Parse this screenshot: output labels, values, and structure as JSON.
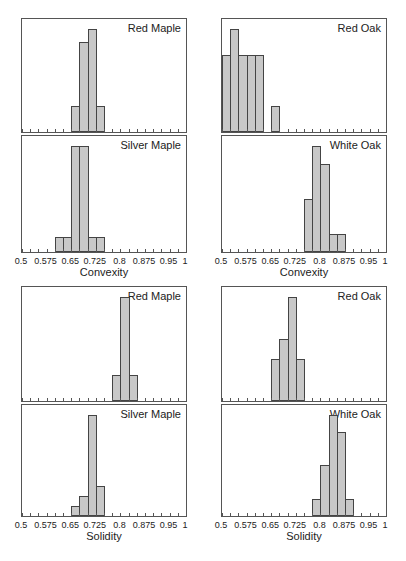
{
  "chart_data": [
    {
      "type": "bar",
      "title": "Red Maple",
      "xlabel": "Convexity",
      "xlim": [
        0.5,
        1.0
      ],
      "bin_width": 0.025,
      "bins_start": [
        0.65,
        0.675,
        0.7,
        0.725
      ],
      "values": [
        2,
        7,
        8,
        2
      ]
    },
    {
      "type": "bar",
      "title": "Silver Maple",
      "xlabel": "Convexity",
      "xlim": [
        0.5,
        1.0
      ],
      "bin_width": 0.025,
      "bins_start": [
        0.6,
        0.625,
        0.65,
        0.675,
        0.7,
        0.725
      ],
      "values": [
        1,
        1,
        7,
        7,
        1,
        1
      ]
    },
    {
      "type": "bar",
      "title": "Red Oak",
      "xlabel": "Convexity",
      "xlim": [
        0.5,
        1.0
      ],
      "bin_width": 0.025,
      "bins_start": [
        0.5,
        0.525,
        0.55,
        0.575,
        0.6,
        0.625,
        0.65
      ],
      "values": [
        3,
        4,
        3,
        3,
        3,
        0,
        1
      ]
    },
    {
      "type": "bar",
      "title": "White Oak",
      "xlabel": "Convexity",
      "xlim": [
        0.5,
        1.0
      ],
      "bin_width": 0.025,
      "bins_start": [
        0.75,
        0.775,
        0.8,
        0.825,
        0.85
      ],
      "values": [
        3,
        6,
        5,
        1,
        1
      ]
    },
    {
      "type": "bar",
      "title": "Red Maple",
      "xlabel": "Solidity",
      "xlim": [
        0.5,
        1.0
      ],
      "bin_width": 0.025,
      "bins_start": [
        0.775,
        0.8,
        0.825
      ],
      "values": [
        1,
        4,
        1
      ]
    },
    {
      "type": "bar",
      "title": "Silver Maple",
      "xlabel": "Solidity",
      "xlim": [
        0.5,
        1.0
      ],
      "bin_width": 0.025,
      "bins_start": [
        0.65,
        0.675,
        0.7,
        0.725
      ],
      "values": [
        1,
        2,
        10,
        3
      ]
    },
    {
      "type": "bar",
      "title": "Red Oak",
      "xlabel": "Solidity",
      "xlim": [
        0.5,
        1.0
      ],
      "bin_width": 0.025,
      "bins_start": [
        0.65,
        0.675,
        0.7,
        0.725
      ],
      "values": [
        2,
        3,
        5,
        2
      ]
    },
    {
      "type": "bar",
      "title": "White Oak",
      "xlabel": "Solidity",
      "xlim": [
        0.5,
        1.0
      ],
      "bin_width": 0.025,
      "bins_start": [
        0.775,
        0.8,
        0.825,
        0.85,
        0.875
      ],
      "values": [
        1,
        3,
        6,
        5,
        1
      ]
    }
  ],
  "axis": {
    "tick_labels": [
      "0.5",
      "0.575",
      "0.65",
      "0.725",
      "0.8",
      "0.875",
      "0.95",
      "1"
    ],
    "tick_label_values": [
      0.5,
      0.575,
      0.65,
      0.725,
      0.8,
      0.875,
      0.95,
      1.0
    ]
  },
  "groups": [
    {
      "xlabel": "Convexity",
      "top": 0,
      "bottom": 1
    },
    {
      "xlabel": "Convexity",
      "top": 2,
      "bottom": 3
    },
    {
      "xlabel": "Solidity",
      "top": 4,
      "bottom": 5
    },
    {
      "xlabel": "Solidity",
      "top": 6,
      "bottom": 7
    }
  ],
  "colors": {
    "bar_fill": "#c8c8c8",
    "bar_edge": "#444444",
    "frame": "#555555"
  }
}
